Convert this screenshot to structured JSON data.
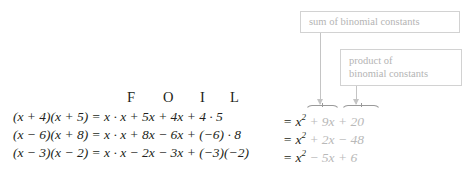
{
  "figure": {
    "type": "math-diagram",
    "topic": "FOIL method for multiplying binomials"
  },
  "callouts": [
    {
      "id": "sum-of-binomial-constants",
      "text": "sum of binomial constants",
      "line1": "sum of binomial constants",
      "line2": "",
      "border_color": "#d2d2d2",
      "text_color": "#b4b4b4"
    },
    {
      "id": "product-of-binomial-constants",
      "text": "product of binomial constants",
      "line1": "product of",
      "line2": "binomial constants",
      "border_color": "#d2d2d2",
      "text_color": "#b4b4b4"
    }
  ],
  "foil_header": {
    "letters": [
      "F",
      "O",
      "I",
      "L"
    ],
    "F": "F",
    "O": "O",
    "I": "I",
    "L": "L"
  },
  "equations": [
    {
      "binomials": "(x + 4)(x + 5)",
      "expansion": "= x · x + 5x + 4x + 4 · 5",
      "result": "= x² + 9x + 20",
      "left_paren_a": "(",
      "result_x2": "x",
      "result_exp": "2",
      "result_middle": "+ 9x",
      "result_last": "+ 20"
    },
    {
      "binomials": "(x − 6)(x + 8)",
      "expansion": "= x · x + 8x − 6x + (−6) · 8",
      "result": "= x² + 2x − 48",
      "result_middle": "+ 2x",
      "result_last": "− 48"
    },
    {
      "binomials": "(x − 3)(x − 2)",
      "expansion": "= x · x − 2x − 3x + (−3)(−2)",
      "result": "= x² − 5x + 6",
      "result_middle": "− 5x",
      "result_last": "+ 6"
    }
  ],
  "arrows": [
    {
      "id": "arrow-from-sum-callout",
      "color": "#c4c4c4",
      "points_to": "+ 9x"
    },
    {
      "id": "arrow-from-product-callout",
      "color": "#c4c4c4",
      "points_to": "+ 20"
    }
  ],
  "braces": [
    {
      "id": "overbrace-sum-term",
      "over": "+ 9x",
      "color": "#9a9a9a"
    },
    {
      "id": "overbrace-product-term",
      "over": "+ 20",
      "color": "#9a9a9a"
    }
  ],
  "colors": {
    "text": "#231f20",
    "faded": "#b9b9b9",
    "callout_border": "#d2d2d2",
    "arrow": "#c4c4c4",
    "background": "#ffffff"
  }
}
